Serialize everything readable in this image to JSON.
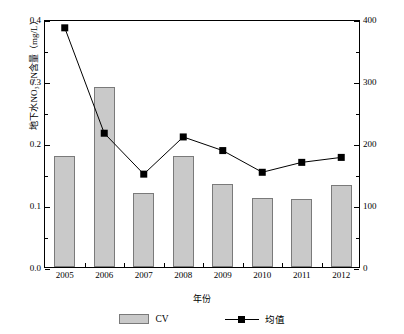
{
  "chart_data": {
    "type": "bar",
    "title": "",
    "xlabel": "年份",
    "ylabel": "地下水NO₃⁻-N含量（mg/L）",
    "ylabel_right": "CV（%）",
    "categories": [
      "2005",
      "2006",
      "2007",
      "2008",
      "2009",
      "2010",
      "2011",
      "2012"
    ],
    "ylim": [
      0.0,
      0.4
    ],
    "ylim_right": [
      0,
      400
    ],
    "yticks": [
      "0.0",
      "0.1",
      "0.2",
      "0.3",
      "0.4"
    ],
    "ytick_values": [
      0.0,
      0.1,
      0.2,
      0.3,
      0.4
    ],
    "yticks_right": [
      "0",
      "100",
      "200",
      "300",
      "400"
    ],
    "ytick_values_right": [
      0,
      100,
      200,
      300,
      400
    ],
    "grid": false,
    "legend_position": "bottom",
    "series": [
      {
        "name": "CV",
        "type": "bar",
        "axis": "right",
        "unit": "%",
        "color": "#c9c9c9",
        "values": [
          179,
          290,
          119,
          179,
          134,
          111,
          110,
          132
        ]
      },
      {
        "name": "均值",
        "type": "line",
        "axis": "left",
        "unit": "mg/L",
        "color": "#000000",
        "marker": "square",
        "values": [
          0.389,
          0.219,
          0.153,
          0.213,
          0.191,
          0.156,
          0.172,
          0.18
        ]
      }
    ]
  },
  "legend": {
    "items": [
      {
        "label": "CV",
        "icon": "bar-swatch"
      },
      {
        "label": "均值",
        "icon": "line-square-marker"
      }
    ]
  }
}
